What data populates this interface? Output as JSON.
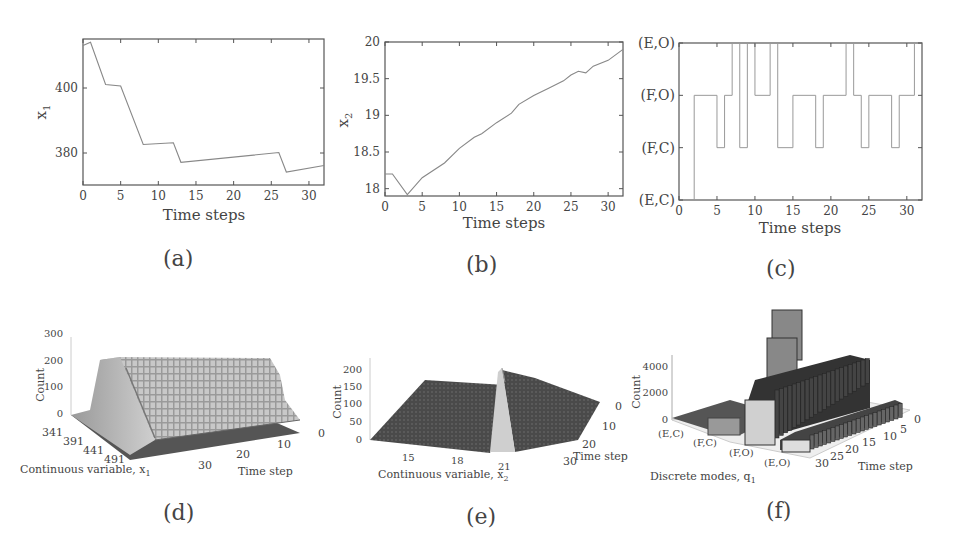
{
  "chart_data": [
    {
      "id": "a",
      "type": "line",
      "title": "",
      "xlabel": "Time steps",
      "ylabel": "x1",
      "xlim": [
        0,
        32
      ],
      "ylim": [
        370,
        415
      ],
      "xticks": [
        0,
        5,
        10,
        15,
        20,
        25,
        30
      ],
      "yticks": [
        380,
        400
      ],
      "x": [
        0,
        1,
        3,
        5,
        8,
        12,
        13,
        26,
        27,
        32
      ],
      "y": [
        413,
        414,
        401,
        400.5,
        382.5,
        383,
        377,
        380,
        374,
        376
      ],
      "grid": false
    },
    {
      "id": "b",
      "type": "line",
      "title": "",
      "xlabel": "Time steps",
      "ylabel": "x2",
      "xlim": [
        0,
        32
      ],
      "ylim": [
        17.9,
        20
      ],
      "xticks": [
        0,
        5,
        10,
        15,
        20,
        25,
        30
      ],
      "yticks": [
        18,
        18.5,
        19,
        19.5,
        20
      ],
      "x": [
        0,
        1,
        3,
        5,
        8,
        10,
        12,
        13,
        15,
        17,
        18,
        20,
        22,
        24,
        25,
        26,
        27,
        28,
        30,
        32
      ],
      "y": [
        18.2,
        18.2,
        17.92,
        18.15,
        18.35,
        18.55,
        18.7,
        18.75,
        18.9,
        19.03,
        19.15,
        19.27,
        19.37,
        19.47,
        19.55,
        19.6,
        19.58,
        19.67,
        19.75,
        19.9
      ],
      "grid": false
    },
    {
      "id": "c",
      "type": "line",
      "step": true,
      "title": "",
      "xlabel": "Time steps",
      "ylabel": "",
      "xlim": [
        0,
        32
      ],
      "xticks": [
        0,
        5,
        10,
        15,
        20,
        25,
        30
      ],
      "ytick_labels": [
        "(E,C)",
        "(F,C)",
        "(F,O)",
        "(E,O)"
      ],
      "steps": [
        {
          "from": 0,
          "to": 2,
          "mode": "(E,C)"
        },
        {
          "from": 2,
          "to": 5,
          "mode": "(F,O)"
        },
        {
          "from": 5,
          "to": 6,
          "mode": "(F,C)"
        },
        {
          "from": 6,
          "to": 7,
          "mode": "(F,O)"
        },
        {
          "from": 7,
          "to": 8,
          "mode": "(E,O)"
        },
        {
          "from": 8,
          "to": 9,
          "mode": "(F,C)"
        },
        {
          "from": 9,
          "to": 10,
          "mode": "(E,O)"
        },
        {
          "from": 10,
          "to": 12,
          "mode": "(F,O)"
        },
        {
          "from": 12,
          "to": 13,
          "mode": "(E,O)"
        },
        {
          "from": 13,
          "to": 15,
          "mode": "(F,C)"
        },
        {
          "from": 15,
          "to": 18,
          "mode": "(F,O)"
        },
        {
          "from": 18,
          "to": 19,
          "mode": "(F,C)"
        },
        {
          "from": 19,
          "to": 22,
          "mode": "(F,O)"
        },
        {
          "from": 22,
          "to": 23,
          "mode": "(E,O)"
        },
        {
          "from": 23,
          "to": 24,
          "mode": "(F,O)"
        },
        {
          "from": 24,
          "to": 25,
          "mode": "(F,C)"
        },
        {
          "from": 25,
          "to": 28,
          "mode": "(F,O)"
        },
        {
          "from": 28,
          "to": 29,
          "mode": "(F,C)"
        },
        {
          "from": 29,
          "to": 31,
          "mode": "(F,O)"
        },
        {
          "from": 31,
          "to": 32,
          "mode": "(E,O)"
        }
      ],
      "grid": false
    },
    {
      "id": "d",
      "type": "heatmap",
      "subtype": "3d-histogram",
      "xlabel": "Continuous variable, x1",
      "ylabel": "Time step",
      "zlabel": "Count",
      "xticks": [
        341,
        391,
        441,
        491
      ],
      "yticks": [
        0,
        10,
        20,
        30
      ],
      "zticks": [
        0,
        100,
        200,
        300
      ],
      "zlim": [
        0,
        300
      ],
      "description": "Ridge of counts ~200 along x1 approx 341-400 across all time steps"
    },
    {
      "id": "e",
      "type": "heatmap",
      "subtype": "3d-histogram",
      "xlabel": "Continuous variable, x2",
      "ylabel": "Time step",
      "zlabel": "Count",
      "xticks": [
        15,
        18,
        21
      ],
      "yticks": [
        0,
        10,
        20,
        30
      ],
      "zticks": [
        0,
        50,
        100,
        150,
        200
      ],
      "zlim": [
        0,
        220
      ],
      "description": "Narrow peak near x2 approx 19-20 with counts up to ~200"
    },
    {
      "id": "f",
      "type": "bar",
      "subtype": "3d-bar",
      "xlabel": "Discrete modes, q1",
      "ylabel": "Time step",
      "zlabel": "Count",
      "categories": [
        "(E,C)",
        "(F,C)",
        "(F,O)",
        "(E,O)"
      ],
      "yticks": [
        0,
        5,
        10,
        15,
        20,
        25,
        30
      ],
      "zticks": [
        0,
        2000,
        4000
      ],
      "series": [
        {
          "name": "(E,C)",
          "approx_count": 200
        },
        {
          "name": "(F,C)",
          "approx_count": 1000
        },
        {
          "name": "(F,O)",
          "approx_count": 3500,
          "peak": 5500
        },
        {
          "name": "(E,O)",
          "approx_count": 1000
        }
      ]
    }
  ],
  "labels": {
    "a": "(a)",
    "b": "(b)",
    "c": "(c)",
    "d": "(d)",
    "e": "(e)",
    "f": "(f)"
  },
  "axes": {
    "a": {
      "xlabel": "Time steps",
      "ylabel": "x",
      "ylabel_sub": "1",
      "xticks": [
        "0",
        "5",
        "10",
        "15",
        "20",
        "25",
        "30"
      ],
      "yticks": [
        "400",
        "380"
      ]
    },
    "b": {
      "xlabel": "Time steps",
      "ylabel": "x",
      "ylabel_sub": "2",
      "xticks": [
        "0",
        "5",
        "10",
        "15",
        "20",
        "25",
        "30"
      ],
      "yticks": [
        "20",
        "19.5",
        "19",
        "18.5",
        "18"
      ]
    },
    "c": {
      "xlabel": "Time steps",
      "xticks": [
        "0",
        "5",
        "10",
        "15",
        "20",
        "25",
        "30"
      ],
      "yticks": [
        "(E,O)",
        "(F,O)",
        "(F,C)",
        "(E,C)"
      ]
    },
    "d": {
      "xlabel": "Continuous variable, x",
      "xlabel_sub": "1",
      "ylabel": "Time step",
      "zlabel": "Count",
      "xticks": [
        "341",
        "391",
        "441",
        "491"
      ],
      "yticks": [
        "0",
        "10",
        "20",
        "30"
      ],
      "zticks": [
        "300",
        "200",
        "100",
        "0"
      ]
    },
    "e": {
      "xlabel": "Continuous variable, x",
      "xlabel_sub": "2",
      "ylabel": "Time step",
      "zlabel": "Count",
      "xticks": [
        "15",
        "18",
        "21"
      ],
      "yticks": [
        "0",
        "10",
        "20",
        "30"
      ],
      "zticks": [
        "200",
        "150",
        "100",
        "50",
        "0"
      ]
    },
    "f": {
      "xlabel": "Discrete modes, q",
      "xlabel_sub": "1",
      "ylabel": "Time step",
      "zlabel": "Count",
      "xticks": [
        "(E,C)",
        "(F,C)",
        "(F,O)",
        "(E,O)"
      ],
      "yticks": [
        "0",
        "5",
        "10",
        "15",
        "20",
        "25",
        "30"
      ],
      "zticks": [
        "4000",
        "2000",
        "0"
      ]
    }
  }
}
